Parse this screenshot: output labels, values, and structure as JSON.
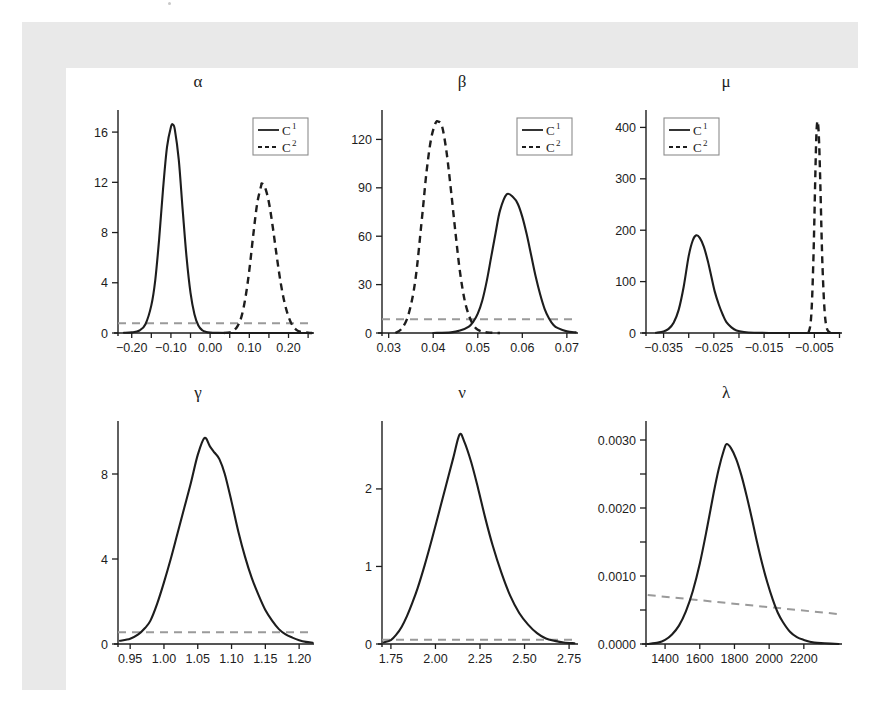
{
  "figure": {
    "background": "#ffffff",
    "frame_color": "#e9e9e9",
    "panel_color": "#ffffff",
    "curve_color": "#1d1d1d",
    "prior_color": "#9a9a9a",
    "legend_items": [
      {
        "label": "C",
        "sup": "1",
        "style": "solid"
      },
      {
        "label": "C",
        "sup": "2",
        "style": "dashed"
      }
    ]
  },
  "chart_data": [
    {
      "type": "line",
      "title": "α",
      "xlabel": "",
      "ylabel": "",
      "grid": false,
      "legend": true,
      "legend_position": "top-right",
      "xlim": [
        -0.235,
        0.265
      ],
      "ylim": [
        0,
        17.6
      ],
      "xticks": [
        -0.2,
        -0.15,
        -0.1,
        -0.05,
        0.0,
        0.05,
        0.1,
        0.15,
        0.2,
        0.25
      ],
      "xticklabels": [
        "-0.20",
        "",
        "-0.10",
        "",
        "0.00",
        "",
        "0.10",
        "",
        "0.20",
        ""
      ],
      "yticks": [
        0,
        4,
        8,
        12,
        16
      ],
      "yticklabels": [
        "0",
        "4",
        "8",
        "12",
        "16"
      ],
      "series": [
        {
          "name": "C1",
          "style": "solid",
          "peak_x": -0.095,
          "peak_y": 16.6,
          "x": [
            -0.22,
            -0.2,
            -0.18,
            -0.165,
            -0.15,
            -0.14,
            -0.13,
            -0.12,
            -0.11,
            -0.1,
            -0.095,
            -0.09,
            -0.08,
            -0.07,
            -0.06,
            -0.05,
            -0.04,
            -0.03,
            -0.02,
            -0.01,
            0.0,
            0.02,
            0.05,
            0.1,
            0.2,
            0.26
          ],
          "y": [
            0.02,
            0.05,
            0.2,
            0.7,
            2.2,
            4.2,
            7.5,
            11.5,
            14.8,
            16.4,
            16.6,
            16.2,
            13.8,
            9.8,
            6.0,
            3.2,
            1.5,
            0.6,
            0.22,
            0.08,
            0.03,
            0.01,
            0.0,
            0.0,
            0.0,
            0.0
          ]
        },
        {
          "name": "C2",
          "style": "dashed",
          "peak_x": 0.132,
          "peak_y": 11.9,
          "x": [
            0.035,
            0.05,
            0.06,
            0.07,
            0.08,
            0.09,
            0.1,
            0.11,
            0.12,
            0.13,
            0.132,
            0.14,
            0.15,
            0.16,
            0.17,
            0.18,
            0.19,
            0.2,
            0.21,
            0.22,
            0.23,
            0.25,
            0.26
          ],
          "y": [
            0.0,
            0.05,
            0.2,
            0.55,
            1.3,
            2.8,
            5.0,
            7.8,
            10.3,
            11.7,
            11.9,
            11.6,
            10.4,
            8.4,
            6.1,
            4.0,
            2.4,
            1.3,
            0.6,
            0.25,
            0.1,
            0.02,
            0.0
          ]
        }
      ],
      "prior": {
        "style": "dashed",
        "color": "#9a9a9a",
        "constant_y": 0.78
      }
    },
    {
      "type": "line",
      "title": "β",
      "xlabel": "",
      "ylabel": "",
      "grid": false,
      "legend": true,
      "legend_position": "top-right",
      "xlim": [
        0.0285,
        0.0725
      ],
      "ylim": [
        0,
        137
      ],
      "xticks": [
        0.03,
        0.04,
        0.05,
        0.06,
        0.07
      ],
      "xticklabels": [
        "0.03",
        "0.04",
        "0.05",
        "0.06",
        "0.07"
      ],
      "yticks": [
        0,
        30,
        60,
        90,
        120
      ],
      "yticklabels": [
        "0",
        "30",
        "60",
        "90",
        "120"
      ],
      "series": [
        {
          "name": "C1",
          "style": "solid",
          "peak_x": 0.0565,
          "peak_y": 86,
          "x": [
            0.04,
            0.044,
            0.046,
            0.048,
            0.049,
            0.05,
            0.051,
            0.052,
            0.053,
            0.054,
            0.055,
            0.0565,
            0.058,
            0.059,
            0.06,
            0.061,
            0.062,
            0.063,
            0.064,
            0.065,
            0.066,
            0.067,
            0.068,
            0.07,
            0.072
          ],
          "y": [
            0.0,
            0.4,
            1.5,
            4.0,
            7.0,
            12.0,
            20.0,
            32.0,
            47.0,
            62.0,
            76.0,
            86.0,
            84.0,
            80.0,
            72.0,
            61.0,
            48.0,
            35.0,
            24.0,
            15.0,
            9.0,
            5.0,
            3.0,
            1.0,
            0.4
          ]
        },
        {
          "name": "C2",
          "style": "dashed",
          "peak_x": 0.0412,
          "peak_y": 131,
          "x": [
            0.0315,
            0.033,
            0.0345,
            0.036,
            0.0375,
            0.0385,
            0.0395,
            0.0405,
            0.0412,
            0.042,
            0.043,
            0.044,
            0.045,
            0.046,
            0.047,
            0.048,
            0.049,
            0.05,
            0.0515,
            0.053,
            0.055
          ],
          "y": [
            0.0,
            3.0,
            12.0,
            33.0,
            72.0,
            100.0,
            120.0,
            130.0,
            131.0,
            128.0,
            112.0,
            88.0,
            62.0,
            38.0,
            21.0,
            11.0,
            5.0,
            2.0,
            0.6,
            0.2,
            0.0
          ]
        }
      ],
      "prior": {
        "style": "dashed",
        "color": "#9a9a9a",
        "constant_y": 8.5
      }
    },
    {
      "type": "line",
      "title": "μ",
      "xlabel": "",
      "ylabel": "",
      "grid": false,
      "legend": true,
      "legend_position": "top-left",
      "xlim": [
        -0.0385,
        0.0005
      ],
      "ylim": [
        0,
        430
      ],
      "xticks": [
        -0.035,
        -0.03,
        -0.025,
        -0.02,
        -0.015,
        -0.01,
        -0.005,
        0.0
      ],
      "xticklabels": [
        "-0.035",
        "",
        "-0.025",
        "",
        "-0.015",
        "",
        "-0.005",
        ""
      ],
      "yticks": [
        0,
        100,
        200,
        300,
        400
      ],
      "yticklabels": [
        "0",
        "100",
        "200",
        "300",
        "400"
      ],
      "series": [
        {
          "name": "C1",
          "style": "solid",
          "peak_x": -0.0285,
          "peak_y": 190,
          "x": [
            -0.0365,
            -0.035,
            -0.034,
            -0.033,
            -0.032,
            -0.031,
            -0.03,
            -0.0292,
            -0.0285,
            -0.0278,
            -0.027,
            -0.0262,
            -0.0255,
            -0.0248,
            -0.024,
            -0.0232,
            -0.0225,
            -0.0215,
            -0.0205,
            -0.019,
            -0.017,
            -0.014,
            -0.01,
            -0.005,
            0.0
          ],
          "y": [
            0.5,
            3.0,
            8.0,
            20.0,
            45.0,
            90.0,
            150.0,
            180.0,
            190.0,
            185.0,
            168.0,
            140.0,
            110.0,
            80.0,
            55.0,
            35.0,
            21.0,
            11.0,
            5.0,
            2.0,
            0.6,
            0.1,
            0.0,
            0.0,
            0.0
          ]
        },
        {
          "name": "C2",
          "style": "dashed",
          "peak_x": -0.0044,
          "peak_y": 412,
          "x": [
            -0.0062,
            -0.0058,
            -0.0055,
            -0.0052,
            -0.005,
            -0.0048,
            -0.0046,
            -0.0044,
            -0.0042,
            -0.004,
            -0.0038,
            -0.0036,
            -0.0034,
            -0.0031,
            -0.0028,
            -0.0024,
            -0.0018
          ],
          "y": [
            0.0,
            15.0,
            55.0,
            140.0,
            220.0,
            310.0,
            385.0,
            412.0,
            400.0,
            355.0,
            285.0,
            205.0,
            135.0,
            65.0,
            25.0,
            6.0,
            0.0
          ]
        }
      ],
      "prior": null
    },
    {
      "type": "line",
      "title": "γ",
      "xlabel": "",
      "ylabel": "",
      "grid": false,
      "legend": false,
      "xlim": [
        0.932,
        1.222
      ],
      "ylim": [
        0,
        10.4
      ],
      "xticks": [
        0.95,
        1.0,
        1.05,
        1.1,
        1.15,
        1.2
      ],
      "xticklabels": [
        "0.95",
        "1.00",
        "1.05",
        "1.10",
        "1.15",
        "1.20"
      ],
      "yticks": [
        0,
        4,
        8
      ],
      "yticklabels": [
        "0",
        "4",
        "8"
      ],
      "series": [
        {
          "name": "C1",
          "style": "solid",
          "peak_x": 1.06,
          "peak_y": 9.7,
          "x": [
            0.935,
            0.95,
            0.962,
            0.972,
            0.98,
            0.99,
            1.0,
            1.01,
            1.02,
            1.03,
            1.04,
            1.05,
            1.06,
            1.068,
            1.075,
            1.082,
            1.09,
            1.1,
            1.11,
            1.12,
            1.13,
            1.14,
            1.15,
            1.16,
            1.17,
            1.18,
            1.19,
            1.2,
            1.21,
            1.22
          ],
          "y": [
            0.15,
            0.25,
            0.45,
            0.75,
            1.1,
            1.9,
            2.9,
            4.0,
            5.2,
            6.4,
            7.6,
            8.9,
            9.7,
            9.3,
            9.0,
            8.7,
            8.0,
            6.7,
            5.3,
            4.1,
            3.1,
            2.3,
            1.6,
            1.1,
            0.7,
            0.45,
            0.3,
            0.18,
            0.1,
            0.06
          ]
        }
      ],
      "prior": {
        "style": "dashed",
        "color": "#9a9a9a",
        "constant_y": 0.55
      }
    },
    {
      "type": "line",
      "title": "ν",
      "xlabel": "",
      "ylabel": "",
      "grid": false,
      "legend": false,
      "xlim": [
        1.7,
        2.8
      ],
      "ylim": [
        0,
        2.85
      ],
      "xticks": [
        1.75,
        2.0,
        2.25,
        2.5,
        2.75
      ],
      "xticklabels": [
        "1.75",
        "2.00",
        "2.25",
        "2.50",
        "2.75"
      ],
      "yticks": [
        0,
        1,
        2
      ],
      "yticklabels": [
        "0",
        "1",
        "2"
      ],
      "series": [
        {
          "name": "C1",
          "style": "solid",
          "peak_x": 2.135,
          "peak_y": 2.7,
          "x": [
            1.71,
            1.75,
            1.78,
            1.81,
            1.84,
            1.87,
            1.9,
            1.94,
            1.98,
            2.02,
            2.06,
            2.1,
            2.135,
            2.16,
            2.2,
            2.24,
            2.28,
            2.32,
            2.37,
            2.42,
            2.47,
            2.52,
            2.57,
            2.62,
            2.67,
            2.72,
            2.78
          ],
          "y": [
            0.02,
            0.05,
            0.12,
            0.22,
            0.36,
            0.53,
            0.72,
            1.02,
            1.35,
            1.7,
            2.05,
            2.4,
            2.7,
            2.62,
            2.35,
            2.0,
            1.62,
            1.28,
            0.92,
            0.62,
            0.4,
            0.25,
            0.14,
            0.07,
            0.04,
            0.02,
            0.01
          ]
        }
      ],
      "prior": {
        "style": "dashed",
        "color": "#9a9a9a",
        "constant_y": 0.055
      }
    },
    {
      "type": "line",
      "title": "λ",
      "xlabel": "",
      "ylabel": "",
      "grid": false,
      "legend": false,
      "xlim": [
        1290,
        2420
      ],
      "ylim": [
        0,
        0.00325
      ],
      "xticks": [
        1400,
        1600,
        1800,
        2000,
        2200
      ],
      "xticklabels": [
        "1400",
        "1600",
        "1800",
        "2000",
        "2200"
      ],
      "yticks": [
        0.0,
        0.0005,
        0.001,
        0.0015,
        0.002,
        0.0025,
        0.003
      ],
      "yticklabels": [
        "0.0000",
        "",
        "0.0010",
        "",
        "0.0020",
        "",
        "0.0030"
      ],
      "series": [
        {
          "name": "C1",
          "style": "solid",
          "peak_x": 1755,
          "peak_y": 0.00294,
          "x": [
            1300,
            1360,
            1400,
            1440,
            1480,
            1520,
            1560,
            1600,
            1640,
            1680,
            1710,
            1740,
            1755,
            1780,
            1810,
            1840,
            1870,
            1900,
            1930,
            1960,
            1990,
            2020,
            2050,
            2080,
            2120,
            2160,
            2200,
            2260,
            2320,
            2400
          ],
          "y": [
            0.0,
            2e-05,
            6e-05,
            0.00014,
            0.00027,
            0.00048,
            0.00078,
            0.00118,
            0.00168,
            0.00222,
            0.00258,
            0.00286,
            0.00294,
            0.00288,
            0.00272,
            0.00248,
            0.00218,
            0.00185,
            0.0015,
            0.00118,
            0.0009,
            0.00066,
            0.00046,
            0.00032,
            0.00018,
            0.0001,
            6e-05,
            2e-05,
            1e-05,
            0.0
          ]
        }
      ],
      "prior": {
        "style": "dashed",
        "color": "#9a9a9a",
        "line_from": [
          1300,
          0.00072
        ],
        "line_to": [
          2400,
          0.00044
        ]
      }
    }
  ]
}
